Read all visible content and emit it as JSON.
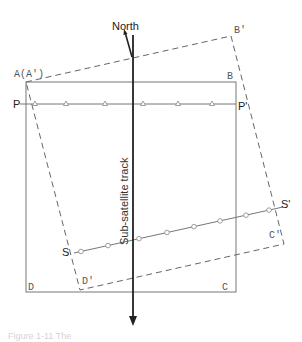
{
  "header_ghost_text": "",
  "caption": "Figure 1-11 The",
  "labels": {
    "north": "North",
    "track": "Sub-satellite track",
    "A": "A(A')",
    "B": "B",
    "C": "C",
    "D": "D",
    "B_prime": "B'",
    "C_prime": "C'",
    "D_prime": "D'",
    "P": "P",
    "P_prime": "P'",
    "S": "S",
    "S_prime": "S'"
  },
  "colors": {
    "frame": "#777777",
    "dashed": "#666666",
    "track": "#222222",
    "markers": "#888888"
  },
  "geometry": {
    "square": {
      "A": [
        26,
        82
      ],
      "B": [
        236,
        82
      ],
      "C": [
        236,
        292
      ],
      "D": [
        26,
        292
      ]
    },
    "rotated_square": {
      "A": [
        26,
        82
      ],
      "B": [
        231,
        36
      ],
      "C": [
        284,
        244
      ],
      "D": [
        80,
        290
      ]
    },
    "P_line": {
      "from": [
        20,
        104
      ],
      "to": [
        236,
        104
      ],
      "triangles_x": [
        35,
        66,
        105,
        143,
        178,
        212
      ]
    },
    "S_line": {
      "from": [
        80,
        252
      ],
      "to": [
        281,
        207
      ],
      "circles_x": [
        80,
        108,
        139,
        166,
        193,
        220,
        246,
        270
      ]
    },
    "track_x": 133,
    "track_y": [
      35,
      325
    ]
  }
}
